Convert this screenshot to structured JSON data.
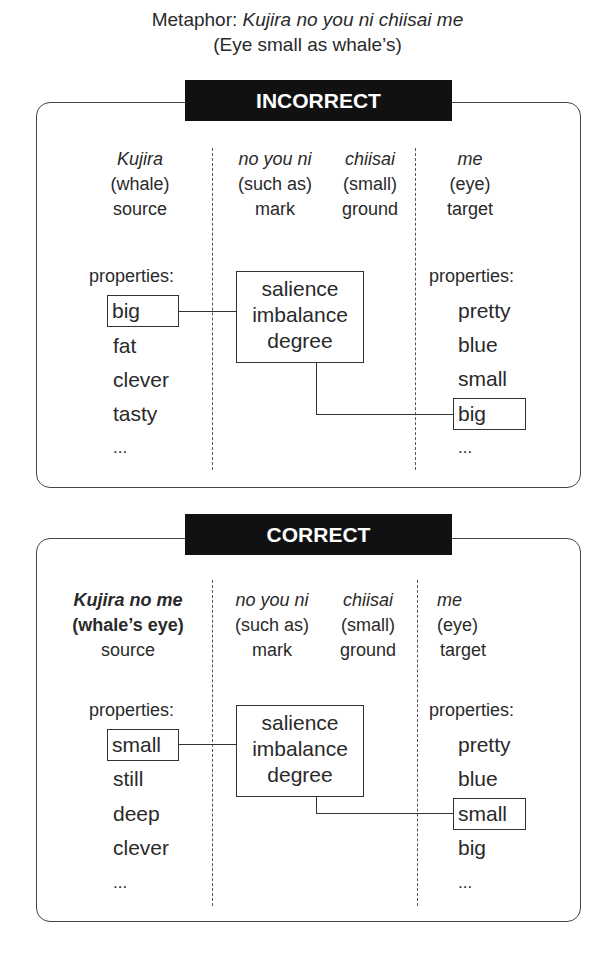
{
  "title": {
    "prefix": "Metaphor: ",
    "phrase": "Kujira no you ni chiisai me",
    "translation": "(Eye small as whale’s)"
  },
  "panels": [
    {
      "label": "INCORRECT",
      "columns": {
        "source": {
          "word": "Kujira",
          "gloss": "(whale)",
          "role": "source"
        },
        "mark": {
          "word": "no you ni",
          "gloss": "(such as)",
          "role": "mark"
        },
        "ground": {
          "word": "chiisai",
          "gloss": "(small)",
          "role": "ground"
        },
        "target": {
          "word": "me",
          "gloss": "(eye)",
          "role": "target"
        }
      },
      "source_properties": {
        "heading": "properties:",
        "items": [
          "big",
          "fat",
          "clever",
          "tasty",
          "..."
        ],
        "highlighted": "big"
      },
      "center_box": {
        "line1": "salience",
        "line2": "imbalance",
        "line3": "degree"
      },
      "target_properties": {
        "heading": "properties:",
        "items": [
          "pretty",
          "blue",
          "small",
          "big",
          "..."
        ],
        "highlighted": "big"
      }
    },
    {
      "label": "CORRECT",
      "columns": {
        "source": {
          "word": "Kujira no me",
          "gloss": "(whale’s eye)",
          "role": "source"
        },
        "mark": {
          "word": "no you ni",
          "gloss": "(such as)",
          "role": "mark"
        },
        "ground": {
          "word": "chiisai",
          "gloss": "(small)",
          "role": "ground"
        },
        "target": {
          "word": "me",
          "gloss": "(eye)",
          "role": "target"
        }
      },
      "source_properties": {
        "heading": "properties:",
        "items": [
          "small",
          "still",
          "deep",
          "clever",
          "..."
        ],
        "highlighted": "small"
      },
      "center_box": {
        "line1": "salience",
        "line2": "imbalance",
        "line3": "degree"
      },
      "target_properties": {
        "heading": "properties:",
        "items": [
          "pretty",
          "blue",
          "small",
          "big",
          "..."
        ],
        "highlighted": "small"
      }
    }
  ],
  "colors": {
    "label_bg": "#111111",
    "label_text": "#ffffff",
    "line": "#333333"
  }
}
